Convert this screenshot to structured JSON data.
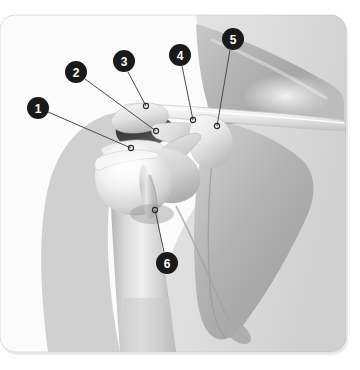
{
  "figure": {
    "kind": "anatomical-illustration",
    "region": "right shoulder, anterior view",
    "background_color": "#ffffff",
    "card": {
      "x": 0,
      "y": 15,
      "width": 346,
      "height": 337,
      "corner_radius": 15,
      "border_color": "#d8d8d8",
      "fill_color": "#fbfbfb"
    },
    "palette": {
      "marker_fill": "#1a1a1a",
      "marker_text": "#ffffff",
      "leader_line": "#4a4a4a",
      "endpoint_ring": "#2a2a2a",
      "bone_light": "#f4f4f4",
      "bone_mid": "#d2d2d2",
      "bone_shade": "#b0b0b0",
      "scapula_grey": "#b4b4b4",
      "deep_shadow": "#3a3a3a",
      "soft_tissue": "#e4e4e4"
    }
  },
  "callouts": [
    {
      "id": "1",
      "label": "1",
      "marker": {
        "cx": 38,
        "cy": 108,
        "r": 11
      },
      "leader": {
        "x1": 48,
        "y1": 112,
        "x2": 131,
        "y2": 148
      },
      "endpoint": {
        "cx": 131,
        "cy": 148,
        "r": 2.6
      },
      "target": "humeral head / greater tuberosity"
    },
    {
      "id": "2",
      "label": "2",
      "marker": {
        "cx": 76,
        "cy": 72,
        "r": 11
      },
      "leader": {
        "x1": 85,
        "y1": 79,
        "x2": 156,
        "y2": 131
      },
      "endpoint": {
        "cx": 156,
        "cy": 131,
        "r": 2.6
      },
      "target": "subacromial space"
    },
    {
      "id": "3",
      "label": "3",
      "marker": {
        "cx": 124,
        "cy": 61,
        "r": 11
      },
      "leader": {
        "x1": 128,
        "y1": 72,
        "x2": 146,
        "y2": 106
      },
      "endpoint": {
        "cx": 146,
        "cy": 106,
        "r": 2.6
      },
      "target": "acromion"
    },
    {
      "id": "4",
      "label": "4",
      "marker": {
        "cx": 180,
        "cy": 55,
        "r": 11
      },
      "leader": {
        "x1": 182,
        "y1": 66,
        "x2": 193,
        "y2": 120
      },
      "endpoint": {
        "cx": 193,
        "cy": 120,
        "r": 2.6
      },
      "target": "coracoacromial ligament"
    },
    {
      "id": "5",
      "label": "5",
      "marker": {
        "cx": 233,
        "cy": 39,
        "r": 11
      },
      "leader": {
        "x1": 230,
        "y1": 50,
        "x2": 217,
        "y2": 126
      },
      "endpoint": {
        "cx": 217,
        "cy": 126,
        "r": 2.6
      },
      "target": "coracoid process"
    },
    {
      "id": "6",
      "label": "6",
      "marker": {
        "cx": 167,
        "cy": 263,
        "r": 11
      },
      "leader": {
        "x1": 164,
        "y1": 252,
        "x2": 155,
        "y2": 210
      },
      "endpoint": {
        "cx": 155,
        "cy": 210,
        "r": 2.6
      },
      "target": "long head of biceps tendon"
    }
  ]
}
